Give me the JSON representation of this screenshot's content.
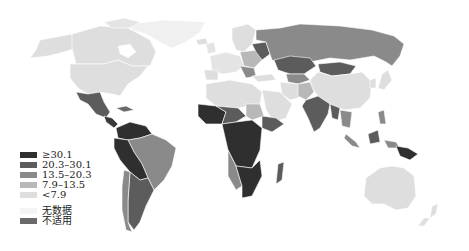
{
  "map": {
    "type": "choropleth world map",
    "colors": {
      "level5": "#2f2f2f",
      "level4": "#5c5c5c",
      "level3": "#8a8a8a",
      "level2": "#b8b8b8",
      "level1": "#dedede",
      "no_data": "#f4f4f4",
      "not_applicable": "#6a6a6a",
      "water": "#ffffff",
      "border": "#ffffff"
    }
  },
  "legend": {
    "items": [
      {
        "label": "≥30.1",
        "color": "#2f2f2f"
      },
      {
        "label": "20.3–30.1",
        "color": "#5c5c5c"
      },
      {
        "label": "13.5–20.3",
        "color": "#8a8a8a"
      },
      {
        "label": "7.9–13.5",
        "color": "#b8b8b8"
      },
      {
        "label": "<7.9",
        "color": "#dedede"
      },
      {
        "label": "无数据",
        "color": "#f4f4f4"
      },
      {
        "label": "不适用",
        "color": "#6a6a6a"
      }
    ]
  }
}
